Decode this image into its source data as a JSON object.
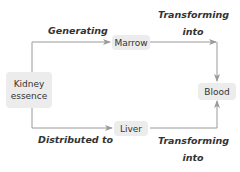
{
  "nodes": {
    "kidney": {
      "line1": "Kidney",
      "line2": "essence"
    },
    "marrow": {
      "label": "Marrow"
    },
    "liver": {
      "label": "Liver"
    },
    "blood": {
      "label": "Blood"
    }
  },
  "edges": {
    "kidney_to_marrow": {
      "label": "Generating"
    },
    "marrow_to_blood": {
      "line1": "Transforming",
      "line2": "into"
    },
    "kidney_to_liver": {
      "label": "Distributed to"
    },
    "liver_to_blood": {
      "line1": "Transforming",
      "line2": "into"
    }
  },
  "colors": {
    "line": "#9a9a9a",
    "node_fill": "#ececec",
    "text": "#333333"
  }
}
